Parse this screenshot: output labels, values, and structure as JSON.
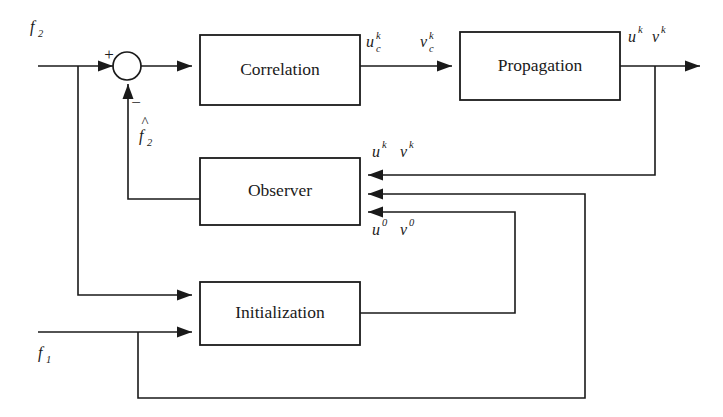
{
  "diagram": {
    "ink_color": "#1a1a1a",
    "background_color": "#ffffff",
    "blocks": [
      {
        "id": "correlation",
        "label": "Correlation"
      },
      {
        "id": "propagation",
        "label": "Propagation"
      },
      {
        "id": "observer",
        "label": "Observer"
      },
      {
        "id": "initialization",
        "label": "Initialization"
      }
    ],
    "summing_junction": {
      "plus_sign": "+",
      "minus_sign": "−"
    },
    "signals": {
      "input_f2": {
        "base": "f",
        "sub": "2",
        "sup": "",
        "hat": false
      },
      "feedback_f2_hat": {
        "base": "f",
        "sub": "2",
        "sup": "",
        "hat": true
      },
      "input_f1": {
        "base": "f",
        "sub": "1",
        "sup": "",
        "hat": false
      },
      "u_c_k": {
        "base": "u",
        "sub": "c",
        "sup": "k",
        "hat": false
      },
      "v_c_k": {
        "base": "v",
        "sub": "c",
        "sup": "k",
        "hat": false
      },
      "u_k_out": {
        "base": "u",
        "sub": "",
        "sup": "k",
        "hat": false
      },
      "v_k_out": {
        "base": "v",
        "sub": "",
        "sup": "k",
        "hat": false
      },
      "u_k_obs": {
        "base": "u",
        "sub": "",
        "sup": "k",
        "hat": false
      },
      "v_k_obs": {
        "base": "v",
        "sub": "",
        "sup": "k",
        "hat": false
      },
      "u_0_obs": {
        "base": "u",
        "sub": "",
        "sup": "0",
        "hat": false
      },
      "v_0_obs": {
        "base": "v",
        "sub": "",
        "sup": "0",
        "hat": false
      }
    }
  }
}
